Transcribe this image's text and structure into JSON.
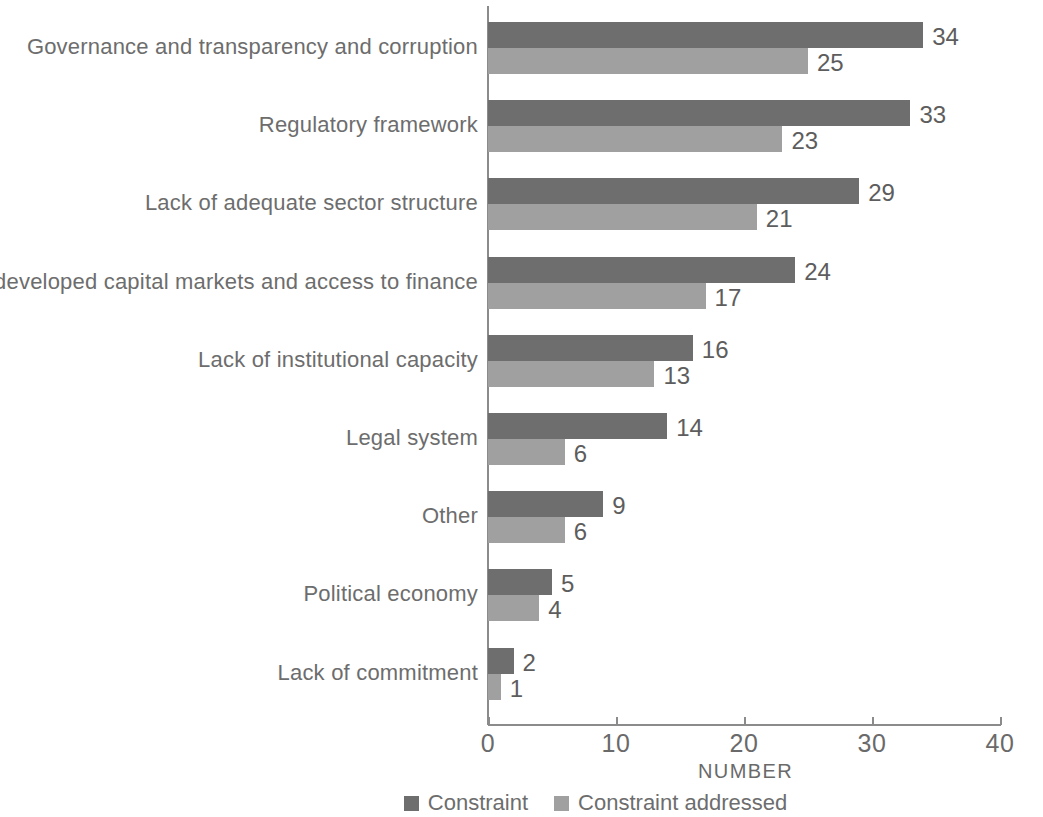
{
  "chart_data": {
    "type": "bar",
    "orientation": "horizontal",
    "title": "",
    "xlabel": "NUMBER",
    "ylabel": "",
    "xlim": [
      0,
      40
    ],
    "xticks": [
      0,
      10,
      20,
      30,
      40
    ],
    "xtick_labels": [
      "0",
      "10",
      "20",
      "30",
      "40"
    ],
    "grid": false,
    "legend_position": "bottom",
    "categories": [
      "Governance and transparency and corruption",
      "Regulatory framework",
      "Lack of adequate sector structure",
      "Underdeveloped capital markets and access to finance",
      "Lack of institutional capacity",
      "Legal system",
      "Other",
      "Political economy",
      "Lack of commitment"
    ],
    "series": [
      {
        "name": "Constraint",
        "color": "#6e6e6e",
        "values": [
          34,
          33,
          29,
          24,
          16,
          14,
          9,
          5,
          2
        ],
        "value_labels": [
          "34",
          "33",
          "29",
          "24",
          "16",
          "14",
          "9",
          "5",
          "2"
        ]
      },
      {
        "name": "Constraint addressed",
        "color": "#a0a0a0",
        "values": [
          25,
          23,
          21,
          17,
          13,
          6,
          6,
          4,
          1
        ],
        "value_labels": [
          "25",
          "23",
          "21",
          "17",
          "13",
          "6",
          "6",
          "4",
          "1"
        ]
      }
    ]
  },
  "legend": {
    "items": [
      {
        "label": "Constraint",
        "color": "#6e6e6e"
      },
      {
        "label": "Constraint addressed",
        "color": "#a0a0a0"
      }
    ]
  },
  "axis": {
    "x_title": "NUMBER"
  },
  "colors": {
    "axis": "#8b8b8b",
    "text": "#6d6d6d",
    "value_text": "#5d5d5d",
    "series_constraint": "#6e6e6e",
    "series_constraint_addressed": "#a0a0a0",
    "background": "#ffffff"
  }
}
